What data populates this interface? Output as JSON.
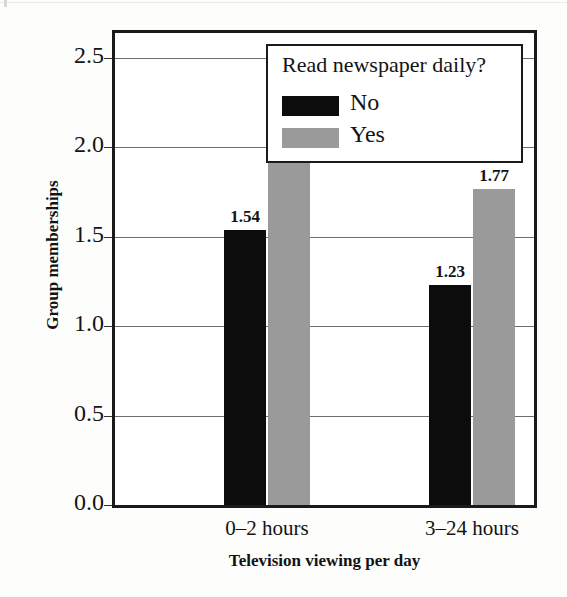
{
  "chart_data": {
    "type": "bar",
    "title": "",
    "xlabel": "Television viewing per day",
    "ylabel": "Group memberships",
    "categories": [
      "0–2 hours",
      "3–24 hours"
    ],
    "series": [
      {
        "name": "No",
        "color": "#0c0c0c",
        "values": [
          1.54,
          1.23
        ],
        "labels": [
          "1.54",
          "1.23"
        ]
      },
      {
        "name": "Yes",
        "color": "#9a9a9a",
        "values": [
          2.15,
          1.77
        ],
        "labels": [
          "2.15",
          "1.77"
        ]
      }
    ],
    "ylim": [
      0.0,
      2.64
    ],
    "yticks": [
      "0.0",
      "0.5",
      "1.0",
      "1.5",
      "2.0",
      "2.5"
    ],
    "ytick_values": [
      0.0,
      0.5,
      1.0,
      1.5,
      2.0,
      2.5
    ],
    "grid": true,
    "legend": {
      "title": "Read newspaper daily?",
      "position": "top-right-inside",
      "entries": [
        {
          "label": "No",
          "color": "#0c0c0c"
        },
        {
          "label": "Yes",
          "color": "#9a9a9a"
        }
      ]
    }
  },
  "colors": {
    "bar_no": "#0c0c0c",
    "bar_yes": "#9a9a9a",
    "frame": "#1a1a1a",
    "grid": "#6e6e6e",
    "text": "#131313",
    "background": "#fdfdfc"
  }
}
